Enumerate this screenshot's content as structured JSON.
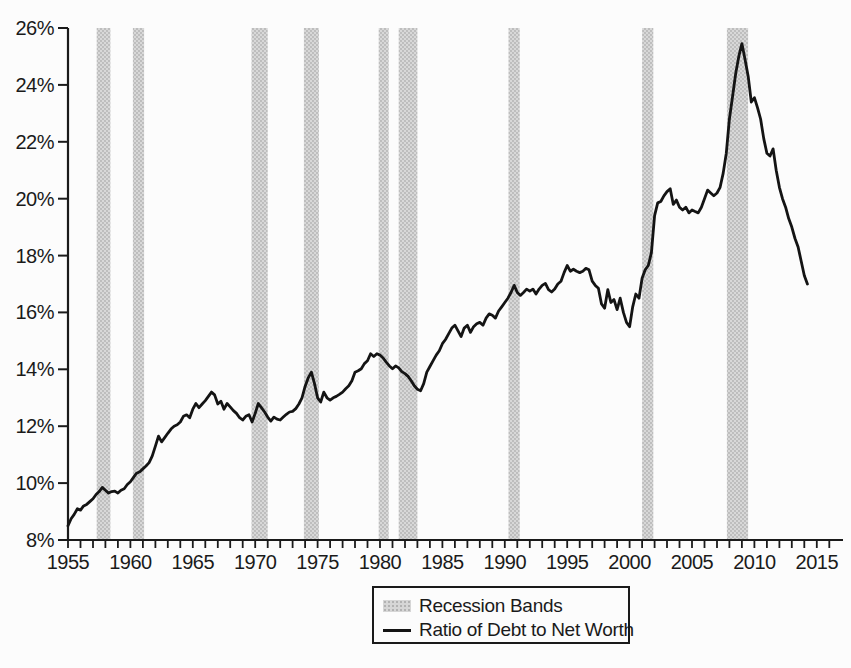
{
  "figure": {
    "background": "#fcfcfc",
    "axis_color": "#1a1a1a",
    "text_color": "#1a1a1a"
  },
  "chart_data": {
    "type": "line",
    "title": "",
    "xlabel": "",
    "ylabel": "",
    "grid": false,
    "x_range": [
      1955,
      2017.1
    ],
    "y_range": [
      8,
      26
    ],
    "x_tick_labels": [
      "1955",
      "1960",
      "1965",
      "1970",
      "1975",
      "1980",
      "1985",
      "1990",
      "1995",
      "2000",
      "2005",
      "2010",
      "2015"
    ],
    "x_tick_years": [
      1955,
      1960,
      1965,
      1970,
      1975,
      1980,
      1985,
      1990,
      1995,
      2000,
      2005,
      2010,
      2015
    ],
    "x_minor_tick_interval": 1,
    "x_minor_tick_last": 2016,
    "y_tick_values": [
      8,
      10,
      12,
      14,
      16,
      18,
      20,
      22,
      24,
      26
    ],
    "y_tick_labels": [
      "8%",
      "10%",
      "12%",
      "14%",
      "16%",
      "18%",
      "20%",
      "22%",
      "24%",
      "26%"
    ],
    "band_color": "#c9c9c9",
    "line_color": "#141414",
    "legend": {
      "position": "bottom-center",
      "border": true,
      "items": [
        {
          "label": "Recession Bands",
          "swatch": "band"
        },
        {
          "label": "Ratio of Debt to Net Worth",
          "swatch": "line"
        }
      ]
    },
    "recession_bands": [
      [
        1957.3,
        1958.4
      ],
      [
        1960.2,
        1961.1
      ],
      [
        1969.7,
        1971.0
      ],
      [
        1973.9,
        1975.1
      ],
      [
        1979.9,
        1980.7
      ],
      [
        1981.5,
        1983.0
      ],
      [
        1990.3,
        1991.2
      ],
      [
        2001.0,
        2001.9
      ],
      [
        2007.8,
        2009.5
      ]
    ],
    "series": [
      {
        "name": "Ratio of Debt to Net Worth",
        "points": [
          [
            1955.0,
            8.5
          ],
          [
            1955.25,
            8.75
          ],
          [
            1955.5,
            8.9
          ],
          [
            1955.75,
            9.1
          ],
          [
            1956.0,
            9.05
          ],
          [
            1956.25,
            9.2
          ],
          [
            1956.5,
            9.25
          ],
          [
            1956.75,
            9.35
          ],
          [
            1957.0,
            9.45
          ],
          [
            1957.25,
            9.6
          ],
          [
            1957.5,
            9.7
          ],
          [
            1957.75,
            9.85
          ],
          [
            1958.0,
            9.75
          ],
          [
            1958.25,
            9.65
          ],
          [
            1958.5,
            9.7
          ],
          [
            1958.75,
            9.72
          ],
          [
            1959.0,
            9.65
          ],
          [
            1959.25,
            9.75
          ],
          [
            1959.5,
            9.8
          ],
          [
            1959.75,
            9.95
          ],
          [
            1960.0,
            10.05
          ],
          [
            1960.25,
            10.2
          ],
          [
            1960.5,
            10.35
          ],
          [
            1960.75,
            10.4
          ],
          [
            1961.0,
            10.5
          ],
          [
            1961.25,
            10.6
          ],
          [
            1961.5,
            10.72
          ],
          [
            1961.75,
            10.95
          ],
          [
            1962.0,
            11.3
          ],
          [
            1962.25,
            11.65
          ],
          [
            1962.5,
            11.45
          ],
          [
            1962.75,
            11.6
          ],
          [
            1963.0,
            11.75
          ],
          [
            1963.25,
            11.9
          ],
          [
            1963.5,
            12.0
          ],
          [
            1963.75,
            12.05
          ],
          [
            1964.0,
            12.15
          ],
          [
            1964.25,
            12.35
          ],
          [
            1964.5,
            12.4
          ],
          [
            1964.75,
            12.3
          ],
          [
            1965.0,
            12.6
          ],
          [
            1965.25,
            12.8
          ],
          [
            1965.5,
            12.65
          ],
          [
            1965.75,
            12.78
          ],
          [
            1966.0,
            12.9
          ],
          [
            1966.25,
            13.05
          ],
          [
            1966.5,
            13.2
          ],
          [
            1966.75,
            13.1
          ],
          [
            1967.0,
            12.78
          ],
          [
            1967.25,
            12.88
          ],
          [
            1967.5,
            12.6
          ],
          [
            1967.75,
            12.8
          ],
          [
            1968.0,
            12.68
          ],
          [
            1968.25,
            12.55
          ],
          [
            1968.5,
            12.45
          ],
          [
            1968.75,
            12.3
          ],
          [
            1969.0,
            12.22
          ],
          [
            1969.25,
            12.35
          ],
          [
            1969.5,
            12.4
          ],
          [
            1969.75,
            12.15
          ],
          [
            1970.0,
            12.45
          ],
          [
            1970.25,
            12.8
          ],
          [
            1970.5,
            12.65
          ],
          [
            1970.75,
            12.5
          ],
          [
            1971.0,
            12.32
          ],
          [
            1971.25,
            12.18
          ],
          [
            1971.5,
            12.32
          ],
          [
            1971.75,
            12.25
          ],
          [
            1972.0,
            12.22
          ],
          [
            1972.25,
            12.32
          ],
          [
            1972.5,
            12.42
          ],
          [
            1972.75,
            12.5
          ],
          [
            1973.0,
            12.52
          ],
          [
            1973.25,
            12.62
          ],
          [
            1973.5,
            12.78
          ],
          [
            1973.75,
            13.0
          ],
          [
            1974.0,
            13.4
          ],
          [
            1974.25,
            13.7
          ],
          [
            1974.5,
            13.9
          ],
          [
            1974.75,
            13.5
          ],
          [
            1975.0,
            13.0
          ],
          [
            1975.25,
            12.85
          ],
          [
            1975.5,
            13.2
          ],
          [
            1975.75,
            13.0
          ],
          [
            1976.0,
            12.92
          ],
          [
            1976.25,
            13.0
          ],
          [
            1976.5,
            13.05
          ],
          [
            1976.75,
            13.12
          ],
          [
            1977.0,
            13.2
          ],
          [
            1977.25,
            13.32
          ],
          [
            1977.5,
            13.42
          ],
          [
            1977.75,
            13.6
          ],
          [
            1978.0,
            13.9
          ],
          [
            1978.25,
            13.95
          ],
          [
            1978.5,
            14.02
          ],
          [
            1978.75,
            14.2
          ],
          [
            1979.0,
            14.3
          ],
          [
            1979.25,
            14.55
          ],
          [
            1979.5,
            14.45
          ],
          [
            1979.75,
            14.55
          ],
          [
            1980.0,
            14.5
          ],
          [
            1980.25,
            14.4
          ],
          [
            1980.5,
            14.25
          ],
          [
            1980.75,
            14.12
          ],
          [
            1981.0,
            14.02
          ],
          [
            1981.25,
            14.12
          ],
          [
            1981.5,
            14.05
          ],
          [
            1981.75,
            13.92
          ],
          [
            1982.0,
            13.85
          ],
          [
            1982.25,
            13.75
          ],
          [
            1982.5,
            13.6
          ],
          [
            1982.75,
            13.42
          ],
          [
            1983.0,
            13.3
          ],
          [
            1983.25,
            13.25
          ],
          [
            1983.5,
            13.5
          ],
          [
            1983.75,
            13.9
          ],
          [
            1984.0,
            14.1
          ],
          [
            1984.25,
            14.3
          ],
          [
            1984.5,
            14.5
          ],
          [
            1984.75,
            14.65
          ],
          [
            1985.0,
            14.9
          ],
          [
            1985.25,
            15.05
          ],
          [
            1985.5,
            15.25
          ],
          [
            1985.75,
            15.45
          ],
          [
            1986.0,
            15.55
          ],
          [
            1986.25,
            15.35
          ],
          [
            1986.5,
            15.15
          ],
          [
            1986.75,
            15.45
          ],
          [
            1987.0,
            15.55
          ],
          [
            1987.25,
            15.3
          ],
          [
            1987.5,
            15.5
          ],
          [
            1987.75,
            15.6
          ],
          [
            1988.0,
            15.65
          ],
          [
            1988.25,
            15.55
          ],
          [
            1988.5,
            15.8
          ],
          [
            1988.75,
            15.95
          ],
          [
            1989.0,
            15.9
          ],
          [
            1989.25,
            15.8
          ],
          [
            1989.5,
            16.05
          ],
          [
            1989.75,
            16.2
          ],
          [
            1990.0,
            16.35
          ],
          [
            1990.25,
            16.5
          ],
          [
            1990.5,
            16.7
          ],
          [
            1990.75,
            16.95
          ],
          [
            1991.0,
            16.7
          ],
          [
            1991.25,
            16.6
          ],
          [
            1991.5,
            16.7
          ],
          [
            1991.75,
            16.82
          ],
          [
            1992.0,
            16.75
          ],
          [
            1992.25,
            16.82
          ],
          [
            1992.5,
            16.65
          ],
          [
            1992.75,
            16.82
          ],
          [
            1993.0,
            16.95
          ],
          [
            1993.25,
            17.02
          ],
          [
            1993.5,
            16.8
          ],
          [
            1993.75,
            16.72
          ],
          [
            1994.0,
            16.82
          ],
          [
            1994.25,
            17.0
          ],
          [
            1994.5,
            17.1
          ],
          [
            1994.75,
            17.4
          ],
          [
            1995.0,
            17.65
          ],
          [
            1995.25,
            17.45
          ],
          [
            1995.5,
            17.52
          ],
          [
            1995.75,
            17.45
          ],
          [
            1996.0,
            17.4
          ],
          [
            1996.25,
            17.45
          ],
          [
            1996.5,
            17.55
          ],
          [
            1996.75,
            17.5
          ],
          [
            1997.0,
            17.1
          ],
          [
            1997.25,
            16.95
          ],
          [
            1997.5,
            16.85
          ],
          [
            1997.75,
            16.3
          ],
          [
            1998.0,
            16.15
          ],
          [
            1998.25,
            16.8
          ],
          [
            1998.5,
            16.35
          ],
          [
            1998.75,
            16.45
          ],
          [
            1999.0,
            16.1
          ],
          [
            1999.25,
            16.5
          ],
          [
            1999.5,
            16.0
          ],
          [
            1999.75,
            15.65
          ],
          [
            2000.0,
            15.5
          ],
          [
            2000.25,
            16.2
          ],
          [
            2000.5,
            16.65
          ],
          [
            2000.75,
            16.5
          ],
          [
            2001.0,
            17.2
          ],
          [
            2001.25,
            17.5
          ],
          [
            2001.5,
            17.65
          ],
          [
            2001.75,
            18.1
          ],
          [
            2002.0,
            19.4
          ],
          [
            2002.25,
            19.85
          ],
          [
            2002.5,
            19.9
          ],
          [
            2002.75,
            20.1
          ],
          [
            2003.0,
            20.25
          ],
          [
            2003.25,
            20.35
          ],
          [
            2003.5,
            19.8
          ],
          [
            2003.75,
            19.95
          ],
          [
            2004.0,
            19.7
          ],
          [
            2004.25,
            19.6
          ],
          [
            2004.5,
            19.7
          ],
          [
            2004.75,
            19.5
          ],
          [
            2005.0,
            19.6
          ],
          [
            2005.25,
            19.55
          ],
          [
            2005.5,
            19.5
          ],
          [
            2005.75,
            19.7
          ],
          [
            2006.0,
            20.0
          ],
          [
            2006.25,
            20.3
          ],
          [
            2006.5,
            20.2
          ],
          [
            2006.75,
            20.1
          ],
          [
            2007.0,
            20.2
          ],
          [
            2007.25,
            20.4
          ],
          [
            2007.5,
            20.9
          ],
          [
            2007.75,
            21.6
          ],
          [
            2008.0,
            22.8
          ],
          [
            2008.25,
            23.6
          ],
          [
            2008.5,
            24.4
          ],
          [
            2008.75,
            25.0
          ],
          [
            2009.0,
            25.45
          ],
          [
            2009.25,
            24.9
          ],
          [
            2009.5,
            24.3
          ],
          [
            2009.75,
            23.4
          ],
          [
            2010.0,
            23.55
          ],
          [
            2010.25,
            23.2
          ],
          [
            2010.5,
            22.8
          ],
          [
            2010.75,
            22.1
          ],
          [
            2011.0,
            21.6
          ],
          [
            2011.25,
            21.5
          ],
          [
            2011.5,
            21.75
          ],
          [
            2011.75,
            21.0
          ],
          [
            2012.0,
            20.4
          ],
          [
            2012.25,
            20.0
          ],
          [
            2012.5,
            19.7
          ],
          [
            2012.75,
            19.3
          ],
          [
            2013.0,
            19.0
          ],
          [
            2013.25,
            18.6
          ],
          [
            2013.5,
            18.3
          ],
          [
            2013.75,
            17.8
          ],
          [
            2014.0,
            17.3
          ],
          [
            2014.25,
            17.0
          ]
        ]
      }
    ]
  }
}
